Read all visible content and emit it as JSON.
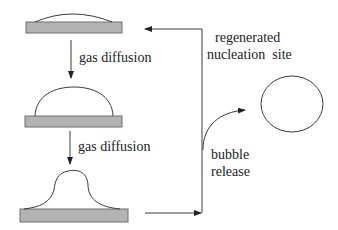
{
  "diagram": {
    "stages": [
      {
        "name": "flat-nucleus",
        "description": "thin gas cap on substrate"
      },
      {
        "name": "growing-bubble",
        "description": "dome-shaped bubble on substrate"
      },
      {
        "name": "necking-bubble",
        "description": "bubble with neck about to detach"
      }
    ],
    "labels": {
      "diffusion_1": "gas diffusion",
      "diffusion_2": "gas diffusion",
      "regenerated_line1": "regenerated",
      "regenerated_line2": "nucleation  site",
      "release_line1": "bubble",
      "release_line2": "release"
    },
    "colors": {
      "substrate_fill": "#b3b3b3",
      "substrate_stroke": "#6e6e6e",
      "line": "#3a3a3a",
      "text": "#222222"
    }
  }
}
